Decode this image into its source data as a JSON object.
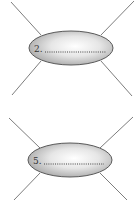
{
  "figures": [
    {
      "number_label": "2.",
      "blank": "dotted line (to fill in)",
      "ellipse": {
        "cx": 71,
        "cy": 48,
        "rx": 42,
        "ry": 17
      },
      "text_pos": {
        "x": 34,
        "y": 52
      },
      "dots": {
        "x1": 45,
        "x2": 106,
        "y": 52
      },
      "legs": [
        {
          "x1": 11,
          "y1": 2,
          "x2": 41,
          "y2": 35
        },
        {
          "x1": 134,
          "y1": 1,
          "x2": 101,
          "y2": 35
        },
        {
          "x1": 41,
          "y1": 61,
          "x2": 12,
          "y2": 95
        },
        {
          "x1": 101,
          "y1": 61,
          "x2": 132,
          "y2": 96
        }
      ]
    },
    {
      "number_label": "5.",
      "blank": "dotted line (to fill in)",
      "ellipse": {
        "cx": 70,
        "cy": 160,
        "rx": 42,
        "ry": 17
      },
      "text_pos": {
        "x": 33,
        "y": 164
      },
      "dots": {
        "x1": 44,
        "x2": 104,
        "y": 164
      },
      "legs": [
        {
          "x1": 9,
          "y1": 118,
          "x2": 40,
          "y2": 148
        },
        {
          "x1": 133,
          "y1": 117,
          "x2": 100,
          "y2": 148
        },
        {
          "x1": 40,
          "y1": 173,
          "x2": 14,
          "y2": 200
        },
        {
          "x1": 100,
          "y1": 173,
          "x2": 127,
          "y2": 200
        }
      ]
    }
  ],
  "colors": {
    "line": "#6e6e6e",
    "ellipse_stroke": "#5a5a5a",
    "ellipse_light": "#ffffff",
    "ellipse_dark": "#a9a9a9"
  }
}
